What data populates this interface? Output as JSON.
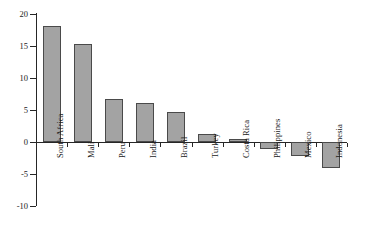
{
  "chart_data": {
    "type": "bar",
    "title": "",
    "subtitle": "",
    "xlabel": "",
    "ylabel": "",
    "categories": [
      "South Africa",
      "Mali",
      "Peru",
      "India",
      "Brazil",
      "Turkey",
      "Costa Rica",
      "Philippines",
      "Mexico",
      "Indonesia"
    ],
    "values": [
      18.1,
      15.3,
      6.7,
      6.1,
      4.7,
      1.2,
      0.4,
      -1.1,
      -2.2,
      -4.0
    ],
    "ylim": [
      -10,
      20
    ],
    "yticks": [
      20,
      15,
      10,
      5,
      0,
      -5,
      -10
    ],
    "ytick_labels": [
      "20",
      "15",
      "10",
      "5",
      "0",
      "-5",
      "-10"
    ],
    "grid": false,
    "legend": null,
    "series": [
      {
        "name": "",
        "values": [
          18.1,
          15.3,
          6.7,
          6.1,
          4.7,
          1.2,
          0.4,
          -1.1,
          -2.2,
          -4.0
        ]
      }
    ],
    "bar_fill_color": "#a3a3a3",
    "bar_edge_color": "#4a4a4a",
    "axis_color": "#262626"
  }
}
